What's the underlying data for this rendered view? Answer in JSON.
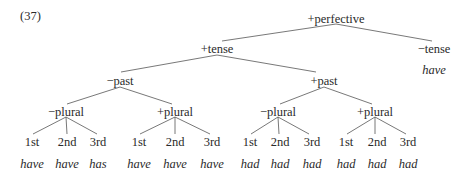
{
  "example_number": "(37)",
  "tree": {
    "root": "+perfective",
    "left": {
      "label": "+tense",
      "past_minus": {
        "label": "−past",
        "plural_minus": {
          "label": "−plural",
          "persons": [
            "1st",
            "2nd",
            "3rd"
          ],
          "forms": [
            "have",
            "have",
            "has"
          ]
        },
        "plural_plus": {
          "label": "+plural",
          "persons": [
            "1st",
            "2nd",
            "3rd"
          ],
          "forms": [
            "have",
            "have",
            "have"
          ]
        }
      },
      "past_plus": {
        "label": "+past",
        "plural_minus": {
          "label": "−plural",
          "persons": [
            "1st",
            "2nd",
            "3rd"
          ],
          "forms": [
            "had",
            "had",
            "had"
          ]
        },
        "plural_plus": {
          "label": "+plural",
          "persons": [
            "1st",
            "2nd",
            "3rd"
          ],
          "forms": [
            "had",
            "had",
            "had"
          ]
        }
      }
    },
    "right": {
      "label": "−tense",
      "form": "have"
    }
  }
}
